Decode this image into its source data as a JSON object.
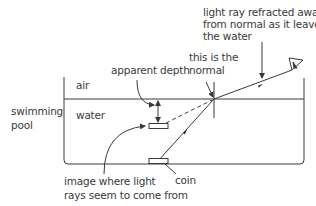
{
  "diagram": {
    "labels": {
      "light_ray_line1": "light ray refracted away",
      "light_ray_line2": "from normal as it leaves",
      "light_ray_line3": "the water",
      "normal_line1": "this is the",
      "normal_line2": "normal",
      "apparent_depth": "apparent depth",
      "air": "air",
      "water": "water",
      "pool_line1": "swimming",
      "pool_line2": "pool",
      "image_line1": "image where light",
      "image_line2": "rays seem to come from",
      "coin": "coin"
    },
    "icons": {
      "eye": "eye-icon"
    },
    "colors": {
      "line": "#3a3a3a",
      "text": "#3a3a3a",
      "background": "#ffffff"
    }
  }
}
